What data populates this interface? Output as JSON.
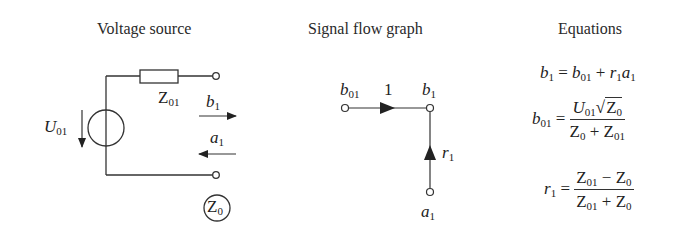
{
  "panels": {
    "voltage_source": {
      "title": "Voltage source",
      "labels": {
        "source": {
          "base": "U",
          "sub": "01"
        },
        "impedance": {
          "base": "Z",
          "sub": "01"
        },
        "wave_out": {
          "base": "b",
          "sub": "1"
        },
        "wave_in": {
          "base": "a",
          "sub": "1"
        },
        "reference": {
          "base": "Z",
          "sub": "0"
        }
      }
    },
    "signal_flow_graph": {
      "title": "Signal flow graph",
      "nodes": {
        "source": {
          "base": "b",
          "sub": "01"
        },
        "out": {
          "base": "b",
          "sub": "1"
        },
        "in": {
          "base": "a",
          "sub": "1"
        }
      },
      "branches": {
        "direct_gain": "1",
        "reflection": {
          "base": "r",
          "sub": "1"
        }
      }
    },
    "equations": {
      "title": "Equations",
      "eq1": {
        "lhs": {
          "base": "b",
          "sub": "1"
        },
        "eq": "=",
        "t1": {
          "base": "b",
          "sub": "01"
        },
        "plus": "+",
        "t2a": {
          "base": "r",
          "sub": "1"
        },
        "t2b": {
          "base": "a",
          "sub": "1"
        }
      },
      "eq2": {
        "lhs": {
          "base": "b",
          "sub": "01"
        },
        "eq": "=",
        "num_u": {
          "base": "U",
          "sub": "01"
        },
        "num_sqrt": {
          "base": "Z",
          "sub": "0"
        },
        "den_a": {
          "base": "Z",
          "sub": "0"
        },
        "den_op": "+",
        "den_b": {
          "base": "Z",
          "sub": "01"
        }
      },
      "eq3": {
        "lhs": {
          "base": "r",
          "sub": "1"
        },
        "eq": "=",
        "num_a": {
          "base": "Z",
          "sub": "01"
        },
        "num_op": "−",
        "num_b": {
          "base": "Z",
          "sub": "0"
        },
        "den_a": {
          "base": "Z",
          "sub": "01"
        },
        "den_op": "+",
        "den_b": {
          "base": "Z",
          "sub": "0"
        }
      }
    }
  }
}
